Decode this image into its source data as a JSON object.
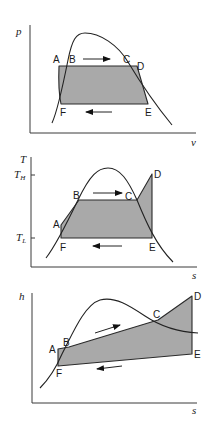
{
  "figure": {
    "point_labels": [
      "A",
      "B",
      "C",
      "D",
      "E",
      "F"
    ],
    "colors": {
      "fill": "#a9a9a9",
      "line": "#222222",
      "background": "#ffffff"
    }
  },
  "diagrams": [
    {
      "id": "p-v",
      "y_axis_label": "p",
      "x_axis_label": "v",
      "labels": {
        "A": "A",
        "B": "B",
        "C": "C",
        "D": "D",
        "E": "E",
        "F": "F"
      },
      "arrows": [
        "right (top, B→C)",
        "left (bottom, E→F)"
      ]
    },
    {
      "id": "T-s",
      "y_axis_label": "T",
      "x_axis_label": "s",
      "tick_high": "T",
      "tick_high_sub": "H",
      "tick_low": "T",
      "tick_low_sub": "L",
      "labels": {
        "A": "A",
        "B": "B",
        "C": "C",
        "D": "D",
        "E": "E",
        "F": "F"
      },
      "arrows": [
        "right (top, B→C)",
        "left (bottom, E→F)"
      ]
    },
    {
      "id": "h-s",
      "y_axis_label": "h",
      "x_axis_label": "s",
      "labels": {
        "A": "A",
        "B": "B",
        "C": "C",
        "D": "D",
        "E": "E",
        "F": "F"
      },
      "arrows": [
        "right (upper, B→C)",
        "left (lower, E→F)"
      ]
    }
  ]
}
